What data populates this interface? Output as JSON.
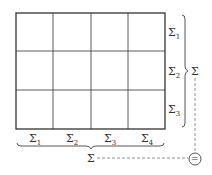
{
  "diagram": {
    "grid": {
      "rows": 3,
      "cols": 4
    },
    "row_sums": [
      {
        "symbol": "Σ",
        "sub": "1"
      },
      {
        "symbol": "Σ",
        "sub": "2"
      },
      {
        "symbol": "Σ",
        "sub": "3"
      }
    ],
    "col_sums": [
      {
        "symbol": "Σ",
        "sub": "1"
      },
      {
        "symbol": "Σ",
        "sub": "2"
      },
      {
        "symbol": "Σ",
        "sub": "3"
      },
      {
        "symbol": "Σ",
        "sub": "4"
      }
    ],
    "row_total": "Σ",
    "col_total": "Σ",
    "equals": "="
  }
}
